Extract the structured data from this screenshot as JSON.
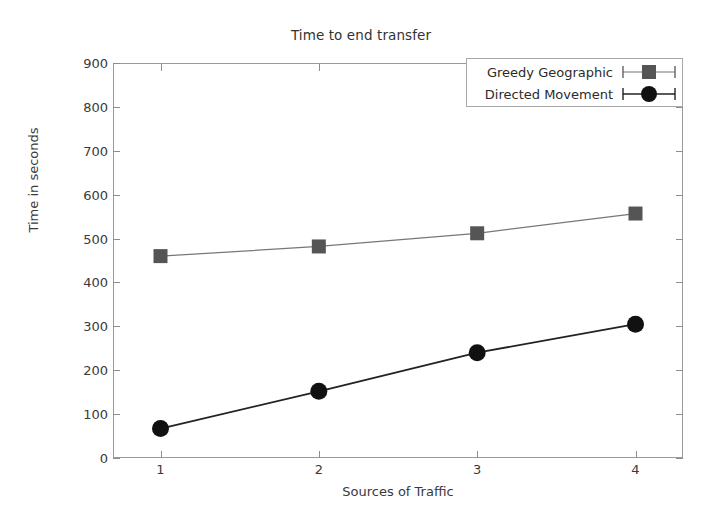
{
  "chart_data": {
    "type": "line",
    "title": "Time to end transfer",
    "xlabel": "Sources of Traffic",
    "ylabel": "Time in seconds",
    "x": [
      1,
      2,
      3,
      4
    ],
    "xtick_labels": [
      "1",
      "2",
      "3",
      "4"
    ],
    "ytick_labels": [
      "0",
      "100",
      "200",
      "300",
      "400",
      "500",
      "600",
      "700",
      "800",
      "900"
    ],
    "yticks": [
      0,
      100,
      200,
      300,
      400,
      500,
      600,
      700,
      800,
      900
    ],
    "xlim": [
      0.7,
      4.3
    ],
    "ylim": [
      0,
      900
    ],
    "grid": false,
    "legend_position": "top-right",
    "series": [
      {
        "name": "Greedy Geographic",
        "values": [
          460,
          482,
          512,
          557
        ],
        "marker": "square",
        "color": "#555555",
        "line_color": "#777777"
      },
      {
        "name": "Directed Movement",
        "values": [
          67,
          152,
          240,
          305
        ],
        "marker": "circle",
        "color": "#111111",
        "line_color": "#222222"
      }
    ]
  },
  "legend": {
    "entries": [
      {
        "label": "Greedy Geographic",
        "marker": "square-marker-icon"
      },
      {
        "label": "Directed Movement",
        "marker": "circle-marker-icon"
      }
    ]
  }
}
